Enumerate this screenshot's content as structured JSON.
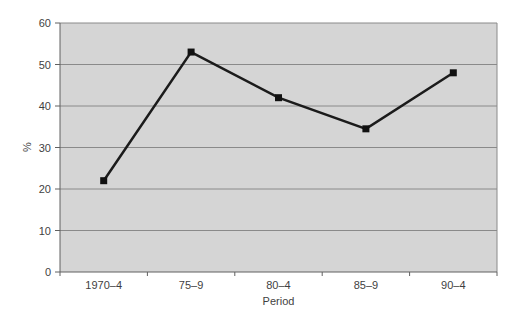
{
  "chart_data": {
    "type": "line",
    "categories": [
      "1970–4",
      "75–9",
      "80–4",
      "85–9",
      "90–4"
    ],
    "series": [
      {
        "name": "percent",
        "values": [
          22,
          53,
          42,
          34.5,
          48
        ]
      }
    ],
    "title": "",
    "xlabel": "Period",
    "ylabel": "%",
    "ylim": [
      0,
      60
    ],
    "ytick_step": 10,
    "ytick_labels": [
      "0",
      "10",
      "20",
      "30",
      "40",
      "50",
      "60"
    ],
    "grid": true,
    "legend": false,
    "layout": {
      "plot_left": 60,
      "plot_top": 23,
      "plot_right": 497,
      "plot_bottom": 272
    },
    "colors": {
      "plot_bg": "#d5d5d5",
      "gridline": "#8a8a8a",
      "axis": "#606060",
      "series_line": "#1b1b1b",
      "marker": "#111111",
      "text": "#3f3f3f",
      "page_bg": "#ffffff"
    }
  }
}
